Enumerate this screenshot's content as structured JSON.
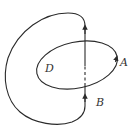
{
  "diagram": {
    "type": "contour-integration-region",
    "labels": {
      "region": "D",
      "point_a": "A",
      "point_b": "B"
    },
    "stroke_color": "#2a2a2a",
    "elements": [
      {
        "name": "ellipse-boundary",
        "description": "Closed tilted ellipse bounding region D, oriented counterclockwise (arrow near A)"
      },
      {
        "name": "outer-loop",
        "description": "Closed curve starting at B, going up through region D (dashed inside), looping around to the left and back to B"
      }
    ]
  }
}
